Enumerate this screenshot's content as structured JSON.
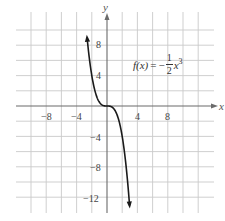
{
  "chart_data": {
    "type": "line",
    "title": "",
    "function_label": {
      "lhs": "f(x)",
      "equals": "=",
      "sign": "−",
      "numerator": "1",
      "denominator": "2",
      "variable": "x",
      "exponent": "3"
    },
    "expression": "f(x) = -1/2 x^3",
    "xlabel": "x",
    "ylabel": "y",
    "xlim": [
      -12,
      14
    ],
    "ylim": [
      -14,
      12
    ],
    "x_ticks": [
      -8,
      -4,
      4,
      8
    ],
    "y_ticks": [
      8,
      4,
      -4,
      -8,
      -12
    ],
    "x_tick_labels": [
      "−8",
      "−4",
      "4",
      "8"
    ],
    "y_tick_labels": [
      "8",
      "4",
      "−4",
      "−8",
      "−12"
    ],
    "grid": true,
    "grid_spacing": 2,
    "series": [
      {
        "name": "f(x) = -1/2 x^3",
        "x": [
          -2.71,
          -2.5,
          -2,
          -1.5,
          -1,
          -0.5,
          0,
          0.5,
          1,
          1.5,
          2,
          2.5,
          3,
          3.04
        ],
        "y": [
          9.95,
          7.81,
          4,
          1.69,
          0.5,
          0.06,
          0,
          -0.06,
          -0.5,
          -1.69,
          -4,
          -7.81,
          -13.5,
          -14.05
        ]
      }
    ],
    "arrows": [
      "curve-top-left",
      "curve-bottom-right",
      "x-axis-right",
      "y-axis-top"
    ]
  }
}
